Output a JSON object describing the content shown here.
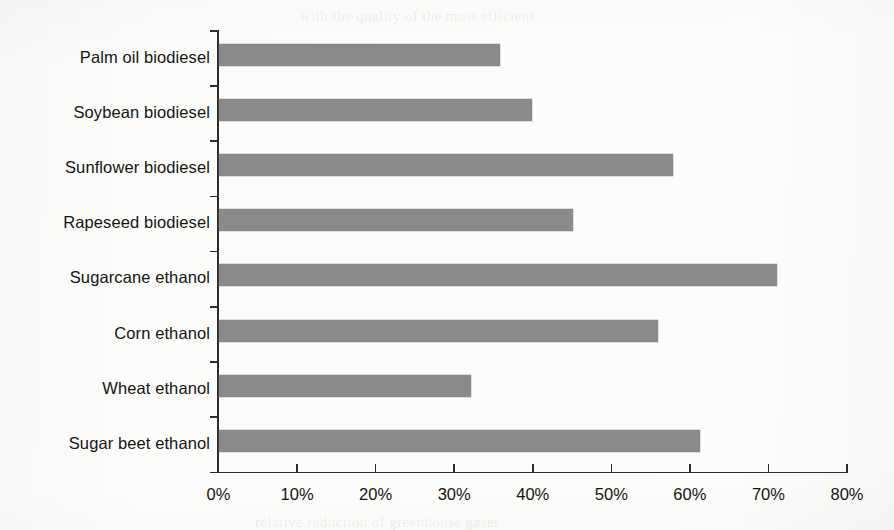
{
  "chart_data": {
    "type": "bar",
    "orientation": "horizontal",
    "title": "",
    "subtitle": "",
    "xlabel": "",
    "ylabel": "",
    "categories": [
      "Palm oil biodiesel",
      "Soybean biodiesel",
      "Sunflower biodiesel",
      "Rapeseed biodiesel",
      "Sugarcane ethanol",
      "Corn ethanol",
      "Wheat ethanol",
      "Sugar beet ethanol"
    ],
    "values": [
      35.8,
      39.9,
      57.8,
      45.1,
      71.1,
      55.9,
      32.2,
      61.3
    ],
    "value_unit": "%",
    "xlim": [
      0,
      80
    ],
    "xticks": [
      0,
      10,
      20,
      30,
      40,
      50,
      60,
      70,
      80
    ],
    "xtick_labels": [
      "0%",
      "10%",
      "20%",
      "30%",
      "40%",
      "50%",
      "60%",
      "70%",
      "80%"
    ],
    "grid": false,
    "legend": false,
    "legend_position": "none",
    "bar_color": "#8a8a8a",
    "axis_color": "#2c2c2c",
    "background_color": "#fcfcfa"
  },
  "ghost_text": {
    "line1": "with the quality of the most efficient",
    "line2": "relative reduction of greenhouse gases"
  }
}
